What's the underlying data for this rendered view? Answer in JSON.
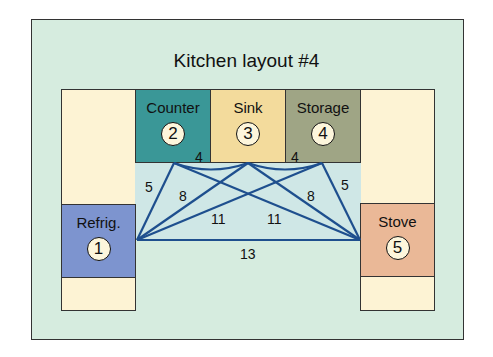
{
  "title": "Kitchen layout #4",
  "colors": {
    "background": "#d6ecdf",
    "cabinet": "#fdf3d4",
    "counter": "#3a9797",
    "sink": "#f3db9c",
    "storage": "#9fa585",
    "refrigerator": "#7d94cf",
    "stove": "#eab897",
    "lines": "#1e4f8e"
  },
  "zones": [
    {
      "id": 1,
      "label": "Refrig.",
      "badge": "1"
    },
    {
      "id": 2,
      "label": "Counter",
      "badge": "2"
    },
    {
      "id": 3,
      "label": "Sink",
      "badge": "3"
    },
    {
      "id": 4,
      "label": "Storage",
      "badge": "4"
    },
    {
      "id": 5,
      "label": "Stove",
      "badge": "5"
    }
  ],
  "distances": [
    {
      "from": 1,
      "to": 2,
      "value": "5"
    },
    {
      "from": 1,
      "to": 3,
      "value": "8"
    },
    {
      "from": 1,
      "to": 4,
      "value": "11"
    },
    {
      "from": 1,
      "to": 5,
      "value": "13"
    },
    {
      "from": 2,
      "to": 3,
      "value": "4"
    },
    {
      "from": 2,
      "to": 5,
      "value": "11"
    },
    {
      "from": 3,
      "to": 4,
      "value": "4"
    },
    {
      "from": 3,
      "to": 5,
      "value": "8"
    },
    {
      "from": 4,
      "to": 5,
      "value": "5"
    }
  ]
}
